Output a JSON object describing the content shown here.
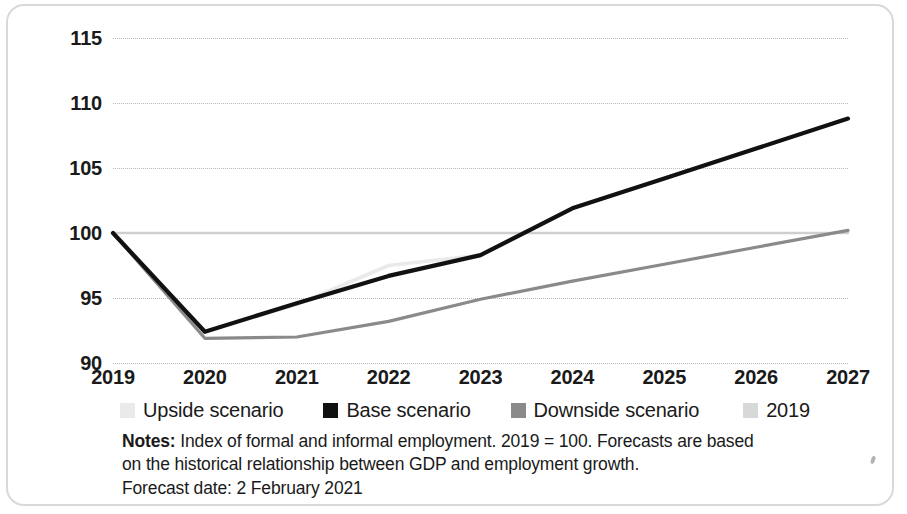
{
  "chart_data": {
    "type": "line",
    "title": "",
    "xlabel": "",
    "ylabel": "",
    "categories": [
      "2019",
      "2020",
      "2021",
      "2022",
      "2023",
      "2024",
      "2025",
      "2026",
      "2027"
    ],
    "x": [
      2019,
      2020,
      2021,
      2022,
      2023,
      2024,
      2025,
      2026,
      2027
    ],
    "ylim": [
      90,
      115
    ],
    "yticks": [
      90,
      95,
      100,
      105,
      110,
      115
    ],
    "grid": true,
    "legend_position": "below-axis",
    "series": [
      {
        "name": "Upside scenario",
        "color": "#eaeaea",
        "values": [
          100.0,
          92.4,
          94.5,
          97.5,
          98.3,
          101.9,
          104.2,
          106.5,
          108.8
        ]
      },
      {
        "name": "Base scenario",
        "color": "#111111",
        "values": [
          100.0,
          92.4,
          94.6,
          96.7,
          98.3,
          101.9,
          104.2,
          106.5,
          108.8
        ]
      },
      {
        "name": "Downside scenario",
        "color": "#8a8a8a",
        "values": [
          100.0,
          91.9,
          92.0,
          93.2,
          94.9,
          96.3,
          97.6,
          98.9,
          100.2
        ]
      },
      {
        "name": "2019",
        "color": "#cfcfcf",
        "values": [
          100.0,
          100.0,
          100.0,
          100.0,
          100.0,
          100.0,
          100.0,
          100.0,
          100.0
        ]
      }
    ]
  },
  "legend": {
    "items": [
      {
        "label": "Upside scenario",
        "color": "#eaeaea"
      },
      {
        "label": "Base scenario",
        "color": "#111111"
      },
      {
        "label": "Downside scenario",
        "color": "#8a8a8a"
      },
      {
        "label": "2019",
        "color": "#d8d8d8"
      }
    ]
  },
  "notes": {
    "lead": "Notes:",
    "line1": " Index of formal and informal employment. 2019 = 100. Forecasts are based",
    "line2": "on the historical relationship between GDP and employment growth.",
    "line3": "Forecast date: 2 February 2021"
  }
}
